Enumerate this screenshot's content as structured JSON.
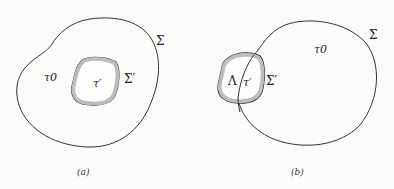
{
  "panels": [
    {
      "id": "a",
      "caption": "(a)",
      "labels": {
        "outer_surface": "Σ",
        "outer_region": "τ0",
        "inner_surface": "Σ′",
        "inner_region": "τ′"
      }
    },
    {
      "id": "b",
      "caption": "(b)",
      "labels": {
        "outer_surface": "Σ",
        "outer_region": "τ0",
        "inner_surface": "Σ′",
        "inner_region": "τ′",
        "outside_part": "Λ"
      }
    }
  ],
  "colors": {
    "stroke": "#333333",
    "shading": "#bdbdbd",
    "background": "#fbfbfa"
  }
}
